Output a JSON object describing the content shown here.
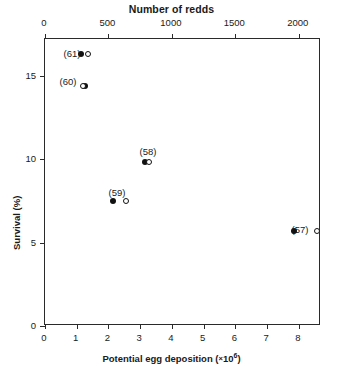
{
  "chart_data": {
    "type": "scatter",
    "title": "Number of redds",
    "xlabel_bottom": "Potential egg deposition (×10⁶)",
    "xlabel_top": "Number of redds",
    "ylabel": "Survival (%)",
    "grid": false,
    "legend": "none",
    "axes": {
      "bottom": {
        "label": "Potential egg deposition (×10⁶)",
        "ticks": [
          0,
          1,
          2,
          3,
          4,
          5,
          6,
          7,
          8
        ],
        "tick_labels": [
          "0",
          "1",
          "2",
          "3",
          "4",
          "5",
          "6",
          "7",
          "8"
        ],
        "range": [
          0,
          8.7
        ]
      },
      "top": {
        "label": "Number of redds",
        "ticks": [
          0,
          500,
          1000,
          1500,
          2000
        ],
        "tick_labels": [
          "0",
          "500",
          "1000",
          "1500",
          "2000"
        ],
        "range": [
          0,
          2175
        ]
      },
      "left": {
        "label": "Survival (%)",
        "ticks": [
          0,
          5,
          10,
          15
        ],
        "tick_labels": [
          "0",
          "5",
          "10",
          "15"
        ],
        "range": [
          0,
          17.2
        ]
      }
    },
    "series": [
      {
        "name": "Potential egg deposition",
        "marker": "filled-circle",
        "axis": "bottom",
        "points": [
          {
            "label": "(61)",
            "x": 1.15,
            "y": 16.3
          },
          {
            "label": "(60)",
            "x": 1.25,
            "y": 14.4
          },
          {
            "label": "(58)",
            "x": 3.15,
            "y": 9.8
          },
          {
            "label": "(59)",
            "x": 2.15,
            "y": 7.5
          },
          {
            "label": "(57)",
            "x": 7.85,
            "y": 5.7
          }
        ]
      },
      {
        "name": "Number of redds",
        "marker": "open-circle",
        "axis": "top",
        "points": [
          {
            "label": "(61)",
            "x": 340,
            "y": 16.3
          },
          {
            "label": "(60)",
            "x": 300,
            "y": 14.4
          },
          {
            "label": "(58)",
            "x": 820,
            "y": 9.8
          },
          {
            "label": "(59)",
            "x": 635,
            "y": 7.5
          },
          {
            "label": "(57)",
            "x": 2140,
            "y": 5.7
          }
        ]
      }
    ],
    "annotations": [
      {
        "text": "(61)",
        "x_px": 72,
        "y_px": 53
      },
      {
        "text": "(60)",
        "x_px": 68,
        "y_px": 81
      },
      {
        "text": "(58)",
        "x_px": 148,
        "y_px": 151
      },
      {
        "text": "(59)",
        "x_px": 117,
        "y_px": 192
      },
      {
        "text": "(57)",
        "x_px": 300,
        "y_px": 229
      }
    ]
  }
}
